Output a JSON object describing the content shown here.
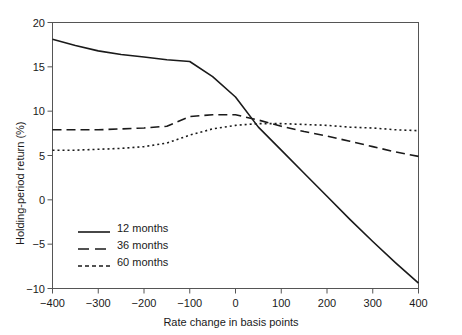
{
  "chart_data": {
    "type": "line",
    "title": "",
    "xlabel": "Rate change in basis points",
    "ylabel": "Holding-period return (%)",
    "xlim": [
      -400,
      400
    ],
    "ylim": [
      -10,
      20
    ],
    "xticks": [
      -400,
      -300,
      -200,
      -100,
      0,
      100,
      200,
      300,
      400
    ],
    "xticklabels": [
      "−400",
      "−300",
      "−200",
      "−100",
      "0",
      "100",
      "200",
      "300",
      "400"
    ],
    "yticks": [
      20,
      15,
      10,
      5,
      0,
      -5,
      -10
    ],
    "yticklabels": [
      "20",
      "15",
      "10",
      "5",
      "0",
      "−5",
      "−10"
    ],
    "grid": false,
    "legend_position": "lower-left-inside",
    "frame": true,
    "x": [
      -400,
      -350,
      -300,
      -250,
      -200,
      -150,
      -100,
      -50,
      0,
      50,
      100,
      150,
      200,
      250,
      300,
      350,
      400
    ],
    "series": [
      {
        "name": "12 months",
        "style": "solid",
        "color": "#1a1a1a",
        "values": [
          18.1,
          17.4,
          16.8,
          16.4,
          16.1,
          15.8,
          15.6,
          13.9,
          11.6,
          8.2,
          5.6,
          3.0,
          0.4,
          -2.2,
          -4.7,
          -7.1,
          -9.4
        ]
      },
      {
        "name": "36 months",
        "style": "dashed",
        "color": "#1a1a1a",
        "values": [
          7.9,
          7.9,
          7.9,
          8.0,
          8.1,
          8.3,
          9.4,
          9.6,
          9.6,
          9.0,
          8.3,
          7.7,
          7.2,
          6.6,
          6.0,
          5.4,
          4.9
        ]
      },
      {
        "name": "60 months",
        "style": "dotted",
        "color": "#1a1a1a",
        "values": [
          5.6,
          5.6,
          5.7,
          5.8,
          6.0,
          6.4,
          7.3,
          8.0,
          8.4,
          8.6,
          8.6,
          8.5,
          8.4,
          8.2,
          8.1,
          7.9,
          7.8
        ]
      }
    ]
  },
  "legend": {
    "items": [
      {
        "label": "12 months",
        "style": "solid"
      },
      {
        "label": "36 months",
        "style": "dashed"
      },
      {
        "label": "60 months",
        "style": "dotted"
      }
    ]
  }
}
